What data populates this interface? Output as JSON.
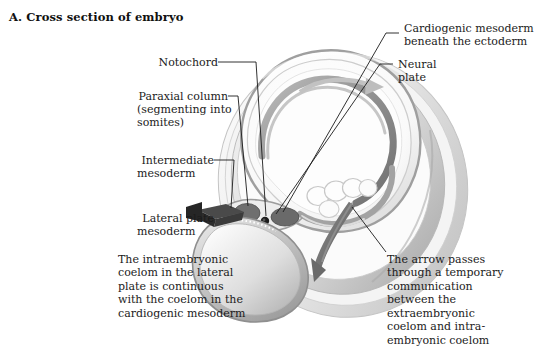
{
  "figure": {
    "title": "A. Cross section of embryo",
    "background_color": "#ffffff",
    "ink_color": "#1b1b1b"
  },
  "labels": {
    "notochord": "Notochord",
    "paraxial_column_line1": "Paraxial column",
    "paraxial_column_line2": "(segmenting into",
    "paraxial_column_line3": "somites)",
    "intermediate_line1": "Intermediate",
    "intermediate_line2": "mesoderm",
    "lateral_plate_line1": "Lateral plate",
    "lateral_plate_line2": "mesoderm",
    "cardiogenic_line1": "Cardiogenic mesoderm",
    "cardiogenic_line2": "beneath the ectoderm",
    "neural_plate_line1": "Neural",
    "neural_plate_line2": "plate"
  },
  "notes": {
    "coelom_note_line1": "The intraembryonic",
    "coelom_note_line2": "coelom in the lateral",
    "coelom_note_line3": "plate is continuous",
    "coelom_note_line4": "with the coelom in the",
    "coelom_note_line5": "cardiogenic mesoderm",
    "arrow_note_line1": "The arrow passes",
    "arrow_note_line2": "through a temporary",
    "arrow_note_line3": "communication",
    "arrow_note_line4": "between the",
    "arrow_note_line5": "extraembryonic",
    "arrow_note_line6": "coelom and intra-",
    "arrow_note_line7": "embryonic coelom"
  },
  "illustration": {
    "description": "Grayscale cross section of an early embryo showing amnion, neural plate, notochord, somites, intermediate and lateral plate mesoderm, yolk sac and coelomic spaces",
    "palette": {
      "outer_membrane": "#d9d9d9",
      "amnion_edge": "#b8b8b8",
      "amniotic_cavity": "#f6f6f6",
      "neural_plate_band": "#9a9a9a",
      "dark_mesoderm": "#6f6f6f",
      "notochord": "#2a2a2a",
      "yolk_sac": "#b0b0b0",
      "yolk_sac_light": "#e4e4e4",
      "arrow_dark": "#6a6a6a",
      "arrow_light": "#c9c9c9",
      "lateral_arrow": "#3a3a3a",
      "leader_line": "#1b1b1b"
    }
  }
}
